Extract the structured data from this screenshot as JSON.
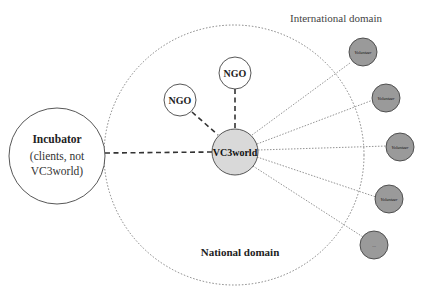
{
  "diagram": {
    "labels": {
      "international_domain": "International domain",
      "national_domain": "National domain"
    },
    "nodes": {
      "center": {
        "label": "VC3world",
        "fill": "#d9d9d9"
      },
      "ngo_top": {
        "label": "NGO"
      },
      "ngo_left": {
        "label": "NGO"
      },
      "incubator": {
        "line1": "Incubator",
        "line2": "(clients, not",
        "line3": "VC3world)"
      },
      "volunteers": [
        {
          "label": "Volunteer"
        },
        {
          "label": "Volunteer"
        },
        {
          "label": "Volunteer"
        },
        {
          "label": "Volunteer"
        },
        {
          "label": "..."
        }
      ]
    },
    "colors": {
      "volunteer_fill": "#9a9a9a",
      "stroke": "#333333",
      "domain_stroke": "#555555"
    },
    "edges": [
      {
        "from": "VC3world",
        "to": "NGO (top)",
        "style": "dashed"
      },
      {
        "from": "VC3world",
        "to": "NGO (left)",
        "style": "dashed"
      },
      {
        "from": "VC3world",
        "to": "Incubator",
        "style": "dashed"
      },
      {
        "from": "VC3world",
        "to": "Volunteer 1",
        "style": "dotted"
      },
      {
        "from": "VC3world",
        "to": "Volunteer 2",
        "style": "dotted"
      },
      {
        "from": "VC3world",
        "to": "Volunteer 3",
        "style": "dotted"
      },
      {
        "from": "VC3world",
        "to": "Volunteer 4",
        "style": "dotted"
      },
      {
        "from": "VC3world",
        "to": "Volunteer 5",
        "style": "dotted"
      }
    ]
  }
}
